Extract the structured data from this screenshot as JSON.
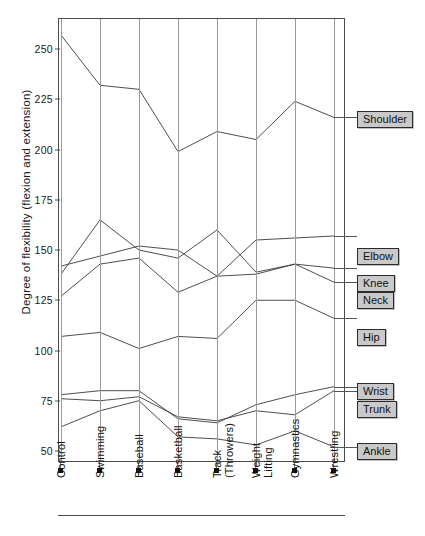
{
  "chart_data": {
    "type": "line",
    "title": "",
    "xlabel": "",
    "ylabel": "Degree of flexibility (flexion and extension)",
    "categories": [
      "Control",
      "Swimming",
      "Baseball",
      "Basketball",
      "Track\n(Throwers)",
      "Weight\nLifting",
      "Gymnastics",
      "Wrestling"
    ],
    "ytick_labels": [
      "250",
      "225",
      "200",
      "175",
      "150",
      "125",
      "100",
      "75",
      "50"
    ],
    "ytick_values": [
      250,
      225,
      200,
      175,
      150,
      125,
      100,
      75,
      50
    ],
    "ylim": [
      45,
      265
    ],
    "grid": "vertical-only",
    "legend_position": "right-inline-labels",
    "series": [
      {
        "name": "Shoulder",
        "values": [
          257,
          232,
          230,
          199,
          209,
          205,
          224,
          216
        ]
      },
      {
        "name": "Elbow",
        "values": [
          142,
          147,
          152,
          150,
          137,
          155,
          156,
          157
        ]
      },
      {
        "name": "Knee",
        "values": [
          138,
          165,
          150,
          146,
          160,
          139,
          143,
          141
        ]
      },
      {
        "name": "Neck",
        "values": [
          127,
          143,
          146,
          129,
          137,
          138,
          143,
          134
        ]
      },
      {
        "name": "Hip",
        "values": [
          107,
          109,
          101,
          107,
          106,
          125,
          125,
          116
        ]
      },
      {
        "name": "Wrist",
        "values": [
          78,
          80,
          80,
          66,
          64,
          73,
          78,
          82
        ]
      },
      {
        "name": "Trunk",
        "values": [
          76,
          75,
          77,
          67,
          65,
          70,
          68,
          80
        ]
      },
      {
        "name": "Ankle",
        "values": [
          62,
          70,
          75,
          57,
          56,
          53,
          60,
          52
        ]
      }
    ]
  },
  "axis": {
    "ytitle": "Degree of flexibility (flexion and extension)"
  },
  "labels": {
    "shoulder": "Shoulder",
    "elbow": "Elbow",
    "knee": "Knee",
    "neck": "Neck",
    "hip": "Hip",
    "wrist": "Wrist",
    "trunk": "Trunk",
    "ankle": "Ankle"
  }
}
